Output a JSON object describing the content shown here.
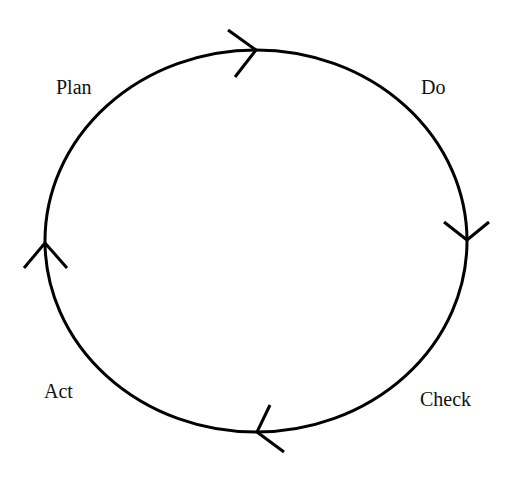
{
  "diagram": {
    "type": "cycle",
    "title": "",
    "stroke_color": "#000000",
    "background": "#ffffff",
    "ellipse": {
      "cx": 256,
      "cy": 241,
      "rx": 211,
      "ry": 191
    },
    "stages": [
      {
        "label": "Plan"
      },
      {
        "label": "Do"
      },
      {
        "label": "Check"
      },
      {
        "label": "Act"
      }
    ],
    "arrows": [
      {
        "position": "top",
        "direction": "right"
      },
      {
        "position": "right",
        "direction": "down"
      },
      {
        "position": "bottom",
        "direction": "left"
      },
      {
        "position": "left",
        "direction": "up"
      }
    ]
  }
}
